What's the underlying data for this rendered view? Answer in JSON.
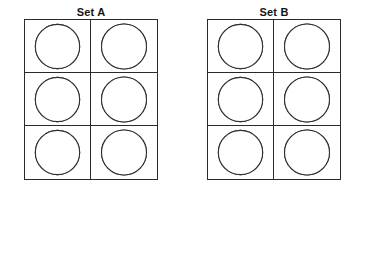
{
  "figure": {
    "background_color": "#ffffff",
    "fill_color": "#000000",
    "line_color": "#303030",
    "sets": [
      {
        "title": "Set A",
        "rows": 3,
        "cols": 2,
        "cells": [
          {
            "row": 1,
            "col": 1,
            "name": "set-a-r1c1",
            "description": "circle with vertical and horizontal diameters, one eighth filled in the lower-left next to the bottom radius",
            "guides": [
              "vertical",
              "horizontal"
            ],
            "filled_sectors": [
              [
                225,
                270
              ]
            ],
            "filled_fraction": 0.125
          },
          {
            "row": 1,
            "col": 2,
            "name": "set-a-r1c2",
            "description": "circle with vertical and horizontal diameters, upper-left quadrant filled",
            "guides": [
              "vertical",
              "horizontal"
            ],
            "filled_sectors": [
              [
                90,
                180
              ]
            ],
            "filled_fraction": 0.25
          },
          {
            "row": 2,
            "col": 1,
            "name": "set-a-r2c1",
            "description": "empty circle with vertical and horizontal diameters, nothing filled",
            "guides": [
              "vertical",
              "horizontal"
            ],
            "filled_sectors": [],
            "filled_fraction": 0
          },
          {
            "row": 2,
            "col": 2,
            "name": "set-a-r2c2",
            "description": "circle with vertical and horizontal diameters, three eighths filled from lower-left diagonal clockwise to the right radius",
            "guides": [
              "vertical",
              "horizontal"
            ],
            "filled_sectors": [
              [
                225,
                360
              ]
            ],
            "filled_fraction": 0.375
          },
          {
            "row": 3,
            "col": 1,
            "name": "set-a-r3c1",
            "description": "circle with vertical and horizontal diameters, half filled along the tilted diagonal from upper-left to lower-right",
            "guides": [
              "vertical",
              "horizontal"
            ],
            "filled_sectors": [
              [
                135,
                315
              ]
            ],
            "filled_fraction": 0.5
          },
          {
            "row": 3,
            "col": 2,
            "name": "set-a-r3c2",
            "description": "circle with vertical and horizontal diameters, three eighths filled from upper-left diagonal down to the bottom radius",
            "guides": [
              "vertical",
              "horizontal"
            ],
            "filled_sectors": [
              [
                135,
                270
              ]
            ],
            "filled_fraction": 0.375
          }
        ]
      },
      {
        "title": "Set B",
        "rows": 3,
        "cols": 2,
        "cells": [
          {
            "row": 1,
            "col": 1,
            "name": "set-b-r1c1",
            "description": "circle almost completely filled, with a very thin white sliver pointing right and slightly downward",
            "guides": [],
            "filled_sectors": [
              [
                352,
                705
              ]
            ],
            "filled_fraction": 0.98
          },
          {
            "row": 1,
            "col": 2,
            "name": "set-b-r1c2",
            "description": "circle with vertical and horizontal diameters, upper-left and lower-right quadrants filled in a checkerboard",
            "guides": [
              "vertical",
              "horizontal"
            ],
            "filled_sectors": [
              [
                90,
                180
              ],
              [
                270,
                360
              ]
            ],
            "filled_fraction": 0.5
          },
          {
            "row": 2,
            "col": 1,
            "name": "set-b-r2c1",
            "description": "circle filled except the white upper-right quadrant",
            "guides": [],
            "filled_sectors": [
              [
                90,
                360
              ]
            ],
            "filled_fraction": 0.75
          },
          {
            "row": 2,
            "col": 2,
            "name": "set-b-r2c2",
            "description": "circle with vertical and horizontal diameters, top half filled",
            "guides": [
              "vertical",
              "horizontal"
            ],
            "filled_sectors": [
              [
                0,
                180
              ]
            ],
            "filled_fraction": 0.5
          },
          {
            "row": 3,
            "col": 1,
            "name": "set-b-r3c1",
            "description": "circle filled except one white eighth wedge in the upper right between the top radius and the upper-right diagonal",
            "guides": [],
            "filled_sectors": [
              [
                135,
                450
              ]
            ],
            "filled_fraction": 0.875
          },
          {
            "row": 3,
            "col": 2,
            "name": "set-b-r3c2",
            "description": "circle divided into eight sectors, alternating filled and white like a pinwheel",
            "guides": [],
            "filled_sectors": [
              [
                0,
                45
              ],
              [
                90,
                135
              ],
              [
                180,
                225
              ],
              [
                270,
                315
              ]
            ],
            "filled_fraction": 0.5
          }
        ]
      }
    ]
  }
}
